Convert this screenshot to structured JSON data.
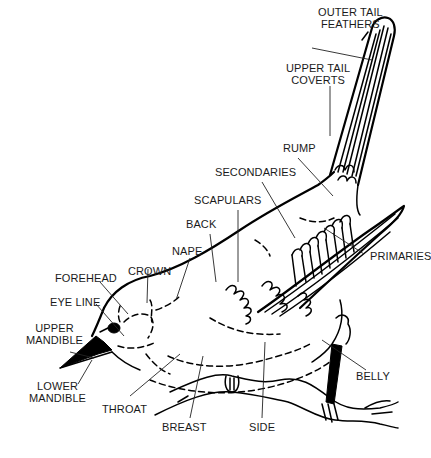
{
  "diagram": {
    "labels": {
      "outer_tail_feathers_1": "OUTER TAIL",
      "outer_tail_feathers_2": "FEATHERS",
      "upper_tail_coverts_1": "UPPER TAIL",
      "upper_tail_coverts_2": "COVERTS",
      "rump": "RUMP",
      "secondaries": "SECONDARIES",
      "scapulars": "SCAPULARS",
      "back": "BACK",
      "primaries": "PRIMARIES",
      "nape": "NAPE",
      "crown": "CROWN",
      "forehead": "FOREHEAD",
      "eye_line": "EYE LINE",
      "upper_mandible_1": "UPPER",
      "upper_mandible_2": "MANDIBLE",
      "lower_mandible_1": "LOWER",
      "lower_mandible_2": "MANDIBLE",
      "throat": "THROAT",
      "breast": "BREAST",
      "side": "SIDE",
      "belly": "BELLY"
    },
    "colors": {
      "background": "#ffffff",
      "ink": "#000000"
    }
  }
}
